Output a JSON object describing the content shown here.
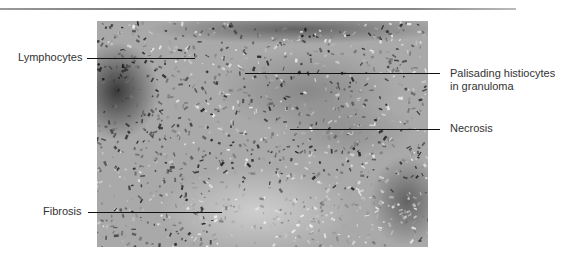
{
  "figure": {
    "labels": [
      {
        "id": "lymphocytes",
        "text": "Lymphocytes"
      },
      {
        "id": "palisading",
        "text_line1": "Palisading histiocytes",
        "text_line2": "in granuloma"
      },
      {
        "id": "necrosis",
        "text": "Necrosis"
      },
      {
        "id": "fibrosis",
        "text": "Fibrosis"
      }
    ]
  }
}
